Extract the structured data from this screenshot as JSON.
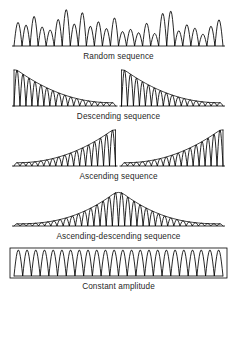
{
  "figure": {
    "background_color": "#ffffff",
    "line_color": "#000000",
    "caption_color": "#1f1f1f",
    "width": 237,
    "height": 350
  },
  "chart_data": {
    "type": "line",
    "xlabel": "",
    "ylabel": "Amplitude",
    "grid": false,
    "legend": "none",
    "panels": [
      {
        "id": "random-sequence",
        "caption": "Random sequence",
        "envelope": "random",
        "baseline": true,
        "frame": false,
        "bursts": 1,
        "cycles": 26,
        "peak_amplitudes": [
          0.62,
          0.55,
          0.78,
          0.5,
          0.42,
          0.7,
          0.96,
          0.58,
          0.88,
          0.52,
          0.64,
          0.46,
          0.74,
          0.38,
          0.44,
          0.35,
          0.6,
          0.33,
          0.86,
          0.92,
          0.4,
          0.56,
          0.47,
          0.31,
          0.52,
          0.69
        ],
        "ylim": [
          0,
          1
        ]
      },
      {
        "id": "descending-sequence",
        "caption": "Descending sequence",
        "envelope": "descending",
        "baseline": true,
        "frame": false,
        "bursts": 2,
        "cycles": 17,
        "envelope_start": 1.0,
        "envelope_end": 0.09,
        "envelope_curve": "exponential-decay",
        "ylim": [
          0,
          1
        ]
      },
      {
        "id": "ascending-sequence",
        "caption": "Ascending sequence",
        "envelope": "ascending",
        "baseline": true,
        "frame": false,
        "bursts": 2,
        "cycles": 17,
        "envelope_start": 0.09,
        "envelope_end": 1.0,
        "envelope_curve": "exponential-rise",
        "ylim": [
          0,
          1
        ]
      },
      {
        "id": "ascending-descending-sequence",
        "caption": "Ascending-descending sequence",
        "envelope": "ascending-descending",
        "baseline": true,
        "frame": false,
        "bursts": 1,
        "cycles": 34,
        "envelope_start": 0.06,
        "envelope_peak": 1.0,
        "envelope_end": 0.06,
        "envelope_curve": "triangular-peak-center",
        "ylim": [
          0,
          1
        ]
      },
      {
        "id": "constant-amplitude",
        "caption": "Constant amplitude",
        "envelope": "constant",
        "baseline": true,
        "frame": true,
        "bursts": 1,
        "cycles": 24,
        "envelope_start": 1.0,
        "envelope_end": 1.0,
        "ylim": [
          0,
          1
        ]
      }
    ]
  }
}
